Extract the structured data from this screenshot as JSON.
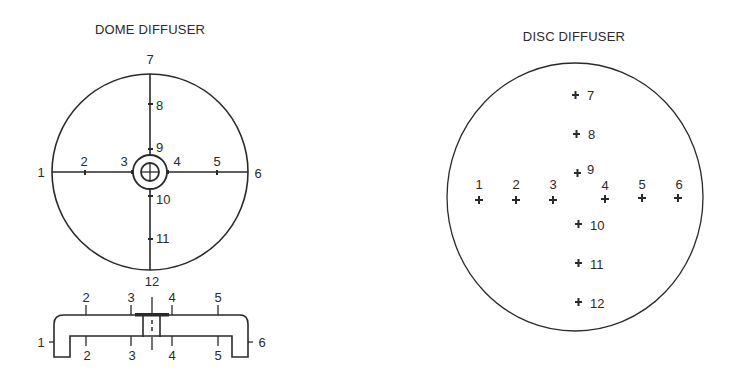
{
  "dome_diffuser": {
    "title": "DOME DIFFUSER",
    "plan_view": {
      "labels": [
        "1",
        "2",
        "3",
        "4",
        "5",
        "6",
        "7",
        "8",
        "9",
        "10",
        "11",
        "12"
      ]
    },
    "cross_section": {
      "top_labels": [
        "2",
        "3",
        "4",
        "5"
      ],
      "bottom_labels": [
        "2",
        "3",
        "4",
        "5"
      ],
      "left_label": "1",
      "right_label": "6",
      "top_center_label": "12"
    }
  },
  "disc_diffuser": {
    "title": "DISC DIFFUSER",
    "points": [
      "1",
      "2",
      "3",
      "4",
      "5",
      "6",
      "7",
      "8",
      "9",
      "10",
      "11",
      "12"
    ]
  },
  "colors": {
    "ink": "#2a2a2a",
    "background": "#ffffff"
  }
}
